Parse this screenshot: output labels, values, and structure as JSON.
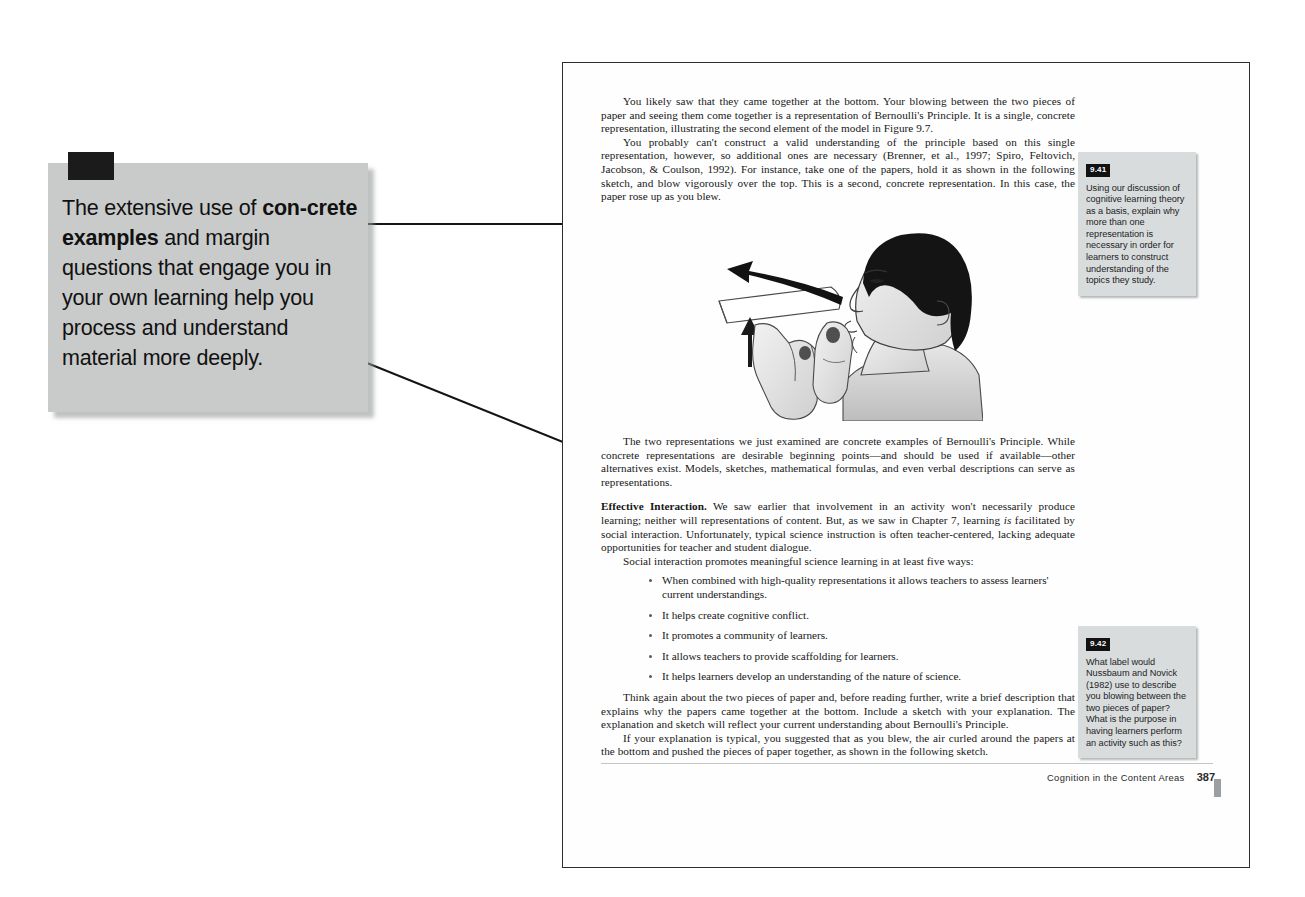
{
  "callout": {
    "marker_icon": "black-square-marker",
    "text_parts": [
      {
        "t": "The extensive use of ",
        "bold": false
      },
      {
        "t": "con-crete examples",
        "bold": true
      },
      {
        "t": " and margin questions that engage you in your own learning help you process and understand material more deeply.",
        "bold": false
      }
    ],
    "plain_text": "The extensive use of concrete examples and margin questions that engage you in your own learning help you process and understand material more deeply."
  },
  "page": {
    "paragraphs": {
      "p1": "You likely saw that they came together at the bottom. Your blowing between the two pieces of paper and seeing them come together is a representation of Bernoulli's Principle. It is a single, concrete representation, illustrating the second element of the model in Figure 9.7.",
      "p2": "You probably can't construct a valid understanding of the principle based on this single representation, however, so additional ones are necessary (Brenner, et al., 1997; Spiro, Feltovich, Jacobson, & Coulson, 1992). For instance, take one of the papers, hold it as shown in the following sketch, and blow vigorously over the top. This is a second, concrete representation. In this case, the paper rose up as you blew.",
      "p3": "The two representations we just examined are concrete examples of Bernoulli's Principle. While concrete representations are desirable beginning points—and should be used if available—other alternatives exist. Models, sketches, mathematical formulas, and even verbal descriptions can serve as representations.",
      "p4_heading": "Effective Interaction.",
      "p4_part1": " We saw earlier that involvement in an activity won't necessarily produce learning; neither will representations of content. But, as we saw in Chapter 7, learning ",
      "p4_italic": "is",
      "p4_part2": " facilitated by social interaction. Unfortunately, typical science instruction is often teacher-centered, lacking adequate opportunities for teacher and student dialogue.",
      "p5": "Social interaction promotes meaningful science learning in at least five ways:",
      "p6": "Think again about the two pieces of paper and, before reading further, write a brief description that explains why the papers came together at the bottom. Include a sketch with your explanation. The explanation and sketch will reflect your current understanding about Bernoulli's Principle.",
      "p7": "If your explanation is typical, you suggested that as you blew, the air curled around the papers at the bottom and pushed the pieces of paper together, as shown in the following sketch."
    },
    "bullets": [
      "When combined with high-quality representations it allows teachers to assess learners' current understandings.",
      "It helps create cognitive conflict.",
      "It promotes a community of learners.",
      "It allows teachers to provide scaffolding for learners.",
      "It helps learners develop an understanding of the nature of science."
    ],
    "figure": {
      "alt_name": "person-blowing-over-paper-illustration",
      "arrow_up_name": "paper-lift-arrow",
      "arrow_air_name": "air-stream-arrow"
    },
    "footer": {
      "running_head": "Cognition in the Content Areas",
      "page_number": "387"
    }
  },
  "margin_notes": [
    {
      "badge": "9.41",
      "text": "Using our discussion of cognitive learning theory as a basis, explain why more than one representation is necessary in order for learners to construct understanding of the topics they study."
    },
    {
      "badge": "9.42",
      "text": "What label would Nussbaum and Novick (1982) use to describe you blowing between the two pieces of paper? What is the purpose in having learners perform an activity such as this?"
    }
  ],
  "colors": {
    "callout_bg": "#c9cbcb",
    "note_bg": "#d9dcdd",
    "badge_bg": "#121212",
    "page_border": "#2e2e2e",
    "leader_line": "#141414"
  }
}
